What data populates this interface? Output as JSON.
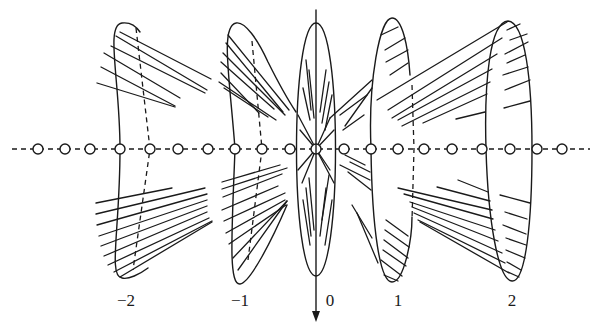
{
  "figure": {
    "width": 599,
    "height": 333,
    "stroke_color": "#1a1a1a",
    "background": "#ffffff",
    "axis": {
      "y": 149,
      "x_start": 12,
      "x_end": 590
    },
    "vertical_axis": {
      "x": 316,
      "y_start": 10,
      "y_end": 322,
      "arrow_direction": "down"
    },
    "nodes": {
      "radius": 5,
      "x": [
        38,
        65,
        90,
        120,
        150,
        178,
        208,
        235,
        262,
        290,
        316,
        344,
        371,
        398,
        424,
        452,
        482,
        510,
        537,
        562
      ]
    },
    "labels": [
      {
        "text": "−2",
        "x": 126,
        "y": 306
      },
      {
        "text": "−1",
        "x": 240,
        "y": 306
      },
      {
        "text": "0",
        "x": 330,
        "y": 306
      },
      {
        "text": "1",
        "x": 398,
        "y": 306
      },
      {
        "text": "2",
        "x": 512,
        "y": 306
      }
    ],
    "cones": [
      {
        "name": "cone-minus-2",
        "outline": "M 120 149 C 120 80, 105 25, 122 23 C 130 22, 136 26, 140 32 M 120 149 C 120 230, 108 276, 122 278 C 128 280, 140 274, 148 268",
        "dashed": "M 136 28 L 150 149 L 133 270",
        "hatches": [
          [
            120,
            32,
            211,
            79
          ],
          [
            116,
            36,
            207,
            90
          ],
          [
            111,
            46,
            205,
            93
          ],
          [
            104,
            53,
            180,
            98
          ],
          [
            101,
            67,
            175,
            106
          ],
          [
            97,
            83,
            175,
            107
          ],
          [
            96,
            203,
            172,
            188
          ],
          [
            96,
            214,
            205,
            188
          ],
          [
            97,
            225,
            207,
            194
          ],
          [
            99,
            236,
            207,
            200
          ],
          [
            101,
            246,
            207,
            206
          ],
          [
            104,
            256,
            207,
            212
          ],
          [
            108,
            265,
            209,
            218
          ],
          [
            114,
            272,
            212,
            221
          ],
          [
            120,
            277,
            212,
            222
          ]
        ]
      },
      {
        "name": "cone-minus-1",
        "outline": "M 235 149 C 230 80, 220 26, 236 23 C 245 21, 258 40, 268 62 C 278 82, 288 100, 296 112 M 235 149 C 232 230, 228 285, 240 284 C 250 283, 272 240, 287 205",
        "dashed": "M 252 41 L 262 149 L 248 260",
        "hatches": [
          [
            228,
            35,
            289,
            110
          ],
          [
            226,
            43,
            283,
            112
          ],
          [
            223,
            53,
            285,
            115
          ],
          [
            221,
            62,
            274,
            109
          ],
          [
            221,
            73,
            259,
            113
          ],
          [
            219,
            82,
            276,
            120
          ],
          [
            224,
            88,
            268,
            117
          ],
          [
            222,
            182,
            280,
            165
          ],
          [
            222,
            189,
            287,
            168
          ],
          [
            223,
            197,
            282,
            174
          ],
          [
            222,
            210,
            278,
            186
          ],
          [
            224,
            221,
            285,
            193
          ],
          [
            226,
            233,
            285,
            200
          ],
          [
            229,
            244,
            286,
            205
          ],
          [
            233,
            258,
            287,
            201
          ],
          [
            238,
            270,
            287,
            201
          ]
        ]
      },
      {
        "name": "cone-0",
        "outline": "M 316 23 C 290 23, 290 275, 316 276 C 342 275, 342 23, 316 23",
        "dashed": "",
        "hatches": [
          [
            306,
            60,
            311,
            110
          ],
          [
            309,
            70,
            314,
            118
          ],
          [
            303,
            88,
            310,
            120
          ],
          [
            326,
            70,
            320,
            112
          ],
          [
            329,
            82,
            322,
            123
          ],
          [
            332,
            95,
            325,
            130
          ],
          [
            298,
            115,
            316,
            149
          ],
          [
            300,
            130,
            316,
            149
          ],
          [
            330,
            118,
            316,
            149
          ],
          [
            334,
            130,
            316,
            149
          ],
          [
            298,
            170,
            316,
            149
          ],
          [
            302,
            183,
            316,
            149
          ],
          [
            330,
            170,
            316,
            149
          ],
          [
            334,
            183,
            316,
            149
          ],
          [
            306,
            188,
            311,
            236
          ],
          [
            309,
            178,
            314,
            230
          ],
          [
            303,
            200,
            310,
            245
          ],
          [
            326,
            188,
            320,
            236
          ],
          [
            329,
            175,
            322,
            220
          ],
          [
            332,
            200,
            325,
            245
          ]
        ]
      },
      {
        "name": "cone-1",
        "outline": "M 371 149 C 368 80, 380 18, 392 18 C 402 18, 408 45, 410 75 M 371 149 C 372 230, 380 282, 392 282 C 404 282, 412 240, 412 217",
        "dashed": "M 412 85 L 414 149 L 412 220",
        "hatches": [
          [
            381,
            35,
            398,
            27
          ],
          [
            385,
            50,
            405,
            38
          ],
          [
            386,
            62,
            408,
            50
          ],
          [
            390,
            75,
            408,
            63
          ],
          [
            372,
            80,
            330,
            118
          ],
          [
            372,
            88,
            345,
            126
          ],
          [
            367,
            95,
            340,
            115
          ],
          [
            364,
            115,
            343,
            130
          ],
          [
            365,
            165,
            345,
            155
          ],
          [
            370,
            172,
            350,
            162
          ],
          [
            370,
            180,
            340,
            165
          ],
          [
            371,
            190,
            348,
            172
          ],
          [
            386,
            220,
            408,
            236
          ],
          [
            385,
            230,
            409,
            247
          ],
          [
            384,
            240,
            408,
            258
          ],
          [
            383,
            250,
            406,
            266
          ],
          [
            381,
            260,
            402,
            276
          ],
          [
            384,
            275,
            398,
            281
          ],
          [
            357,
            213,
            378,
            263
          ],
          [
            352,
            205,
            372,
            238
          ]
        ]
      },
      {
        "name": "cone-2",
        "outline": "M 486 149 C 484 80, 490 22, 508 21 C 525 22, 532 80, 532 149 C 532 220, 526 282, 512 281 C 498 280, 488 220, 486 149",
        "dashed": "",
        "hatches": [
          [
            507,
            22,
            377,
            100
          ],
          [
            502,
            38,
            388,
            110
          ],
          [
            497,
            54,
            392,
            118
          ],
          [
            492,
            69,
            398,
            120
          ],
          [
            490,
            82,
            402,
            126
          ],
          [
            487,
            94,
            423,
            123
          ],
          [
            485,
            112,
            456,
            119
          ],
          [
            507,
            30,
            520,
            24
          ],
          [
            510,
            40,
            527,
            34
          ],
          [
            505,
            54,
            528,
            42
          ],
          [
            507,
            63,
            525,
            55
          ],
          [
            503,
            75,
            528,
            67
          ],
          [
            505,
            90,
            530,
            80
          ],
          [
            504,
            108,
            530,
            101
          ],
          [
            488,
            192,
            458,
            180
          ],
          [
            490,
            201,
            437,
            187
          ],
          [
            492,
            210,
            398,
            188
          ],
          [
            493,
            219,
            404,
            194
          ],
          [
            495,
            230,
            410,
            202
          ],
          [
            498,
            241,
            412,
            207
          ],
          [
            502,
            253,
            414,
            213
          ],
          [
            505,
            263,
            418,
            220
          ],
          [
            509,
            273,
            420,
            222
          ],
          [
            500,
            195,
            530,
            203
          ],
          [
            505,
            212,
            527,
            219
          ],
          [
            503,
            225,
            526,
            234
          ],
          [
            506,
            238,
            526,
            245
          ],
          [
            506,
            250,
            525,
            258
          ],
          [
            507,
            262,
            521,
            270
          ],
          [
            508,
            272,
            519,
            277
          ]
        ]
      }
    ]
  }
}
